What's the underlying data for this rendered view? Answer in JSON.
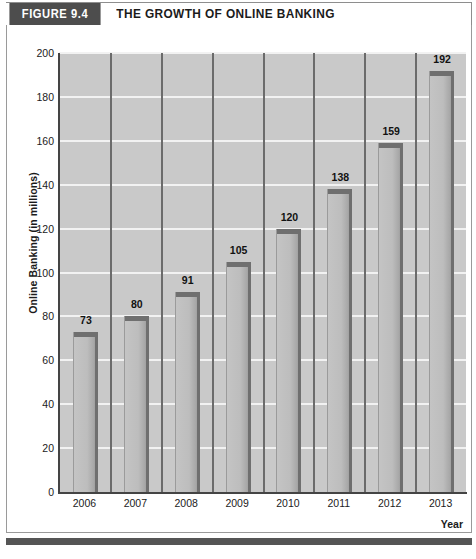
{
  "header": {
    "figure_tag": "FIGURE 9.4",
    "title": "THE GROWTH OF ONLINE BANKING"
  },
  "colors": {
    "tag_background": "#4d4d4d",
    "plot_background": "#c9c9c9",
    "gridline": "#f2f2f2",
    "bar_fill": "#bdbdbd",
    "bar_edge": "#6f6f6f",
    "axis": "#444444",
    "bottom_rule": "#555555"
  },
  "chart_data": {
    "type": "bar",
    "title": "THE GROWTH OF ONLINE BANKING",
    "xlabel": "Year",
    "ylabel": "Online Banking (in millions)",
    "categories": [
      "2006",
      "2007",
      "2008",
      "2009",
      "2010",
      "2011",
      "2012",
      "2013"
    ],
    "values": [
      73,
      80,
      91,
      105,
      120,
      138,
      159,
      192
    ],
    "data_labels": [
      "73",
      "80",
      "91",
      "105",
      "120",
      "138",
      "159",
      "192"
    ],
    "ylim": [
      0,
      200
    ],
    "ytick_step": 20,
    "yticks": [
      0,
      20,
      40,
      60,
      80,
      100,
      120,
      140,
      160,
      180,
      200
    ],
    "ytick_labels": [
      "0",
      "20",
      "40",
      "60",
      "80",
      "100",
      "120",
      "140",
      "160",
      "180",
      "200"
    ],
    "grid": "horizontal",
    "legend": "none"
  },
  "caption": {
    "cut_off_text": ""
  }
}
